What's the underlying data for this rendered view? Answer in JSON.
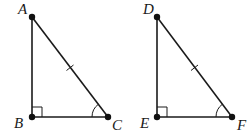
{
  "diagram": {
    "type": "geometry-congruent-right-triangles",
    "triangles": [
      {
        "name": "triangle-ABC",
        "vertices": [
          {
            "label": "A",
            "x": 32,
            "y": 17
          },
          {
            "label": "B",
            "x": 32,
            "y": 117
          },
          {
            "label": "C",
            "x": 108,
            "y": 117
          }
        ],
        "right_angle_at": "B",
        "marked_angle_at": "C",
        "tick_marked_side": "AC"
      },
      {
        "name": "triangle-DEF",
        "vertices": [
          {
            "label": "D",
            "x": 157,
            "y": 17
          },
          {
            "label": "E",
            "x": 157,
            "y": 117
          },
          {
            "label": "F",
            "x": 232,
            "y": 117
          }
        ],
        "right_angle_at": "E",
        "marked_angle_at": "F",
        "tick_marked_side": "DF"
      }
    ]
  },
  "labels": {
    "A": "A",
    "B": "B",
    "C": "C",
    "D": "D",
    "E": "E",
    "F": "F"
  }
}
